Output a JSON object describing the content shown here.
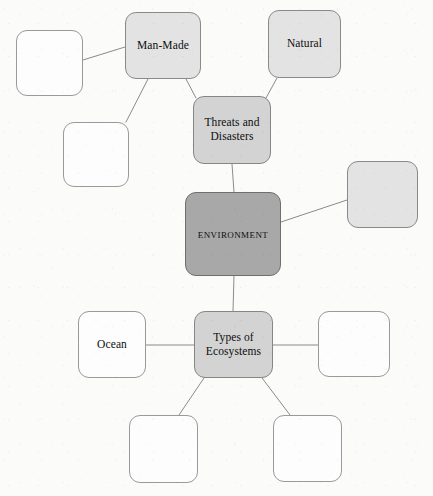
{
  "diagram": {
    "type": "concept-map",
    "canvas": {
      "width": 433,
      "height": 496,
      "background": "#fbfbfa"
    },
    "colors": {
      "node_dark_fill": "#a8a8a8",
      "node_mid_fill": "#d3d3d3",
      "node_light_fill": "#e3e3e3",
      "node_empty_fill": "#fdfdfd",
      "node_border": "#8e8e8e",
      "edge_stroke": "#8b8b8b",
      "text": "#0d0d0d"
    },
    "nodes": [
      {
        "id": "environment",
        "label": "Environment",
        "style": "dark",
        "smallcaps": true,
        "x": 185,
        "y": 192,
        "w": 96,
        "h": 84
      },
      {
        "id": "threats-and-disasters",
        "label": "Threats and\nDisasters",
        "style": "mid",
        "smallcaps": false,
        "x": 193,
        "y": 96,
        "w": 78,
        "h": 68
      },
      {
        "id": "types-of-ecosystems",
        "label": "Types of\nEcosystems",
        "style": "mid",
        "smallcaps": false,
        "x": 194,
        "y": 311,
        "w": 79,
        "h": 67
      },
      {
        "id": "man-made",
        "label": "Man-Made",
        "style": "light",
        "smallcaps": false,
        "x": 125,
        "y": 12,
        "w": 76,
        "h": 67
      },
      {
        "id": "natural",
        "label": "Natural",
        "style": "light",
        "smallcaps": false,
        "x": 268,
        "y": 10,
        "w": 73,
        "h": 68
      },
      {
        "id": "ocean",
        "label": "Ocean",
        "style": "empty",
        "smallcaps": false,
        "x": 78,
        "y": 311,
        "w": 68,
        "h": 67
      },
      {
        "id": "blank-top-left",
        "label": "",
        "style": "empty",
        "smallcaps": false,
        "x": 16,
        "y": 30,
        "w": 67,
        "h": 66
      },
      {
        "id": "blank-left-lower",
        "label": "",
        "style": "empty",
        "smallcaps": false,
        "x": 63,
        "y": 122,
        "w": 66,
        "h": 65
      },
      {
        "id": "blank-right-of-environment",
        "label": "",
        "style": "light",
        "smallcaps": false,
        "x": 347,
        "y": 161,
        "w": 71,
        "h": 67
      },
      {
        "id": "blank-right-of-ecosystems",
        "label": "",
        "style": "empty",
        "smallcaps": false,
        "x": 318,
        "y": 311,
        "w": 72,
        "h": 66
      },
      {
        "id": "blank-bottom-left",
        "label": "",
        "style": "empty",
        "smallcaps": false,
        "x": 129,
        "y": 415,
        "w": 69,
        "h": 68
      },
      {
        "id": "blank-bottom-right",
        "label": "",
        "style": "empty",
        "smallcaps": false,
        "x": 273,
        "y": 415,
        "w": 69,
        "h": 67
      }
    ],
    "edges": [
      {
        "id": "edge-environment-threats",
        "from": "environment",
        "to": "threats-and-disasters",
        "x1": 234,
        "y1": 192,
        "x2": 232,
        "y2": 164
      },
      {
        "id": "edge-environment-ecosystems",
        "from": "environment",
        "to": "types-of-ecosystems",
        "x1": 234,
        "y1": 276,
        "x2": 233,
        "y2": 311
      },
      {
        "id": "edge-environment-blankright",
        "from": "environment",
        "to": "blank-right-of-environment",
        "x1": 281,
        "y1": 222,
        "x2": 347,
        "y2": 200
      },
      {
        "id": "edge-threats-manmade",
        "from": "threats-and-disasters",
        "to": "man-made",
        "x1": 196,
        "y1": 98,
        "x2": 186,
        "y2": 79
      },
      {
        "id": "edge-threats-natural",
        "from": "threats-and-disasters",
        "to": "natural",
        "x1": 266,
        "y1": 98,
        "x2": 277,
        "y2": 78
      },
      {
        "id": "edge-manmade-blanktopleft",
        "from": "man-made",
        "to": "blank-top-left",
        "x1": 125,
        "y1": 47,
        "x2": 83,
        "y2": 60
      },
      {
        "id": "edge-manmade-blankleftlower",
        "from": "man-made",
        "to": "blank-left-lower",
        "x1": 148,
        "y1": 79,
        "x2": 126,
        "y2": 122
      },
      {
        "id": "edge-ecosystems-ocean",
        "from": "types-of-ecosystems",
        "to": "ocean",
        "x1": 194,
        "y1": 345,
        "x2": 146,
        "y2": 345
      },
      {
        "id": "edge-ecosystems-blankright",
        "from": "types-of-ecosystems",
        "to": "blank-right-of-ecosystems",
        "x1": 273,
        "y1": 345,
        "x2": 318,
        "y2": 345
      },
      {
        "id": "edge-ecosystems-blankbottomleft",
        "from": "types-of-ecosystems",
        "to": "blank-bottom-left",
        "x1": 204,
        "y1": 378,
        "x2": 179,
        "y2": 415
      },
      {
        "id": "edge-ecosystems-blankbottomright",
        "from": "types-of-ecosystems",
        "to": "blank-bottom-right",
        "x1": 262,
        "y1": 378,
        "x2": 290,
        "y2": 415
      }
    ]
  }
}
